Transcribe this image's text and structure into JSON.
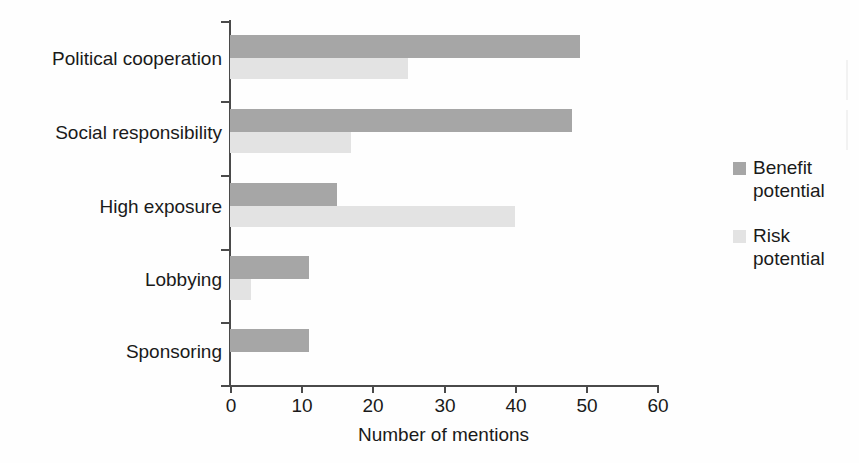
{
  "chart_data": {
    "type": "bar",
    "orientation": "horizontal",
    "title": "",
    "xlabel": "Number of mentions",
    "ylabel": "",
    "xlim": [
      0,
      60
    ],
    "xticks": [
      "0",
      "10",
      "20",
      "30",
      "40",
      "50",
      "60"
    ],
    "grid": false,
    "legend_position": "right",
    "categories": [
      "Political cooperation",
      "Social responsibility",
      "High exposure",
      "Lobbying",
      "Sponsoring"
    ],
    "series": [
      {
        "name": "Benefit potential",
        "color": "#a6a6a6",
        "values": [
          49,
          48,
          15,
          11,
          11
        ]
      },
      {
        "name": "Risk potential",
        "color": "#e3e3e3",
        "values": [
          25,
          17,
          40,
          3,
          0
        ]
      }
    ]
  },
  "legend": {
    "items": [
      {
        "label": "Benefit potential",
        "swatch": "benefit-swatch"
      },
      {
        "label": "Risk potential",
        "swatch": "risk-swatch"
      }
    ]
  },
  "axis": {
    "x_title": "Number of mentions",
    "tick_labels": [
      "0",
      "10",
      "20",
      "30",
      "40",
      "50",
      "60"
    ]
  }
}
